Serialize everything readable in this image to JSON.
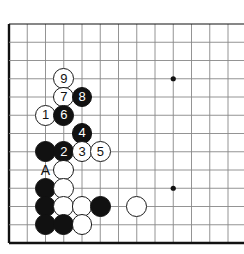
{
  "diagram": {
    "type": "go-board-diagram",
    "board": {
      "origin_x": 9,
      "origin_y": 24,
      "spacing": 18.25,
      "cols": 13,
      "rows": 13,
      "edges": {
        "left": true,
        "top": true,
        "bottom": true,
        "right": false
      },
      "line_color": "#888888",
      "edge_color": "#111111",
      "background": "#ffffff"
    },
    "star_points": [
      {
        "col": 9,
        "row": 3
      },
      {
        "col": 9,
        "row": 9
      }
    ],
    "colors": {
      "black_stone": "#111111",
      "white_stone": "#ffffff",
      "stone_outline": "#1a1a1a",
      "black_number_text": "#ffffff",
      "white_number_text": "#111111"
    },
    "stones": [
      {
        "id": "move-9",
        "color": "white",
        "col": 3,
        "row": 3,
        "label": "9"
      },
      {
        "id": "move-7",
        "color": "white",
        "col": 3,
        "row": 4,
        "label": "7"
      },
      {
        "id": "move-8",
        "color": "black",
        "col": 4,
        "row": 4,
        "label": "8"
      },
      {
        "id": "move-1",
        "color": "white",
        "col": 2,
        "row": 5,
        "label": "1"
      },
      {
        "id": "move-6",
        "color": "black",
        "col": 3,
        "row": 5,
        "label": "6"
      },
      {
        "id": "move-4",
        "color": "black",
        "col": 4,
        "row": 6,
        "label": "4"
      },
      {
        "id": "black-stone-c2r7",
        "color": "black",
        "col": 2,
        "row": 7,
        "label": ""
      },
      {
        "id": "move-2",
        "color": "black",
        "col": 3,
        "row": 7,
        "label": "2"
      },
      {
        "id": "move-3",
        "color": "white",
        "col": 4,
        "row": 7,
        "label": "3"
      },
      {
        "id": "move-5",
        "color": "white",
        "col": 5,
        "row": 7,
        "label": "5"
      },
      {
        "id": "white-stone-c3r8",
        "color": "white",
        "col": 3,
        "row": 8,
        "label": ""
      },
      {
        "id": "black-stone-c2r9",
        "color": "black",
        "col": 2,
        "row": 9,
        "label": ""
      },
      {
        "id": "white-stone-c3r9",
        "color": "white",
        "col": 3,
        "row": 9,
        "label": ""
      },
      {
        "id": "black-stone-c2r10",
        "color": "black",
        "col": 2,
        "row": 10,
        "label": ""
      },
      {
        "id": "white-stone-c3r10",
        "color": "white",
        "col": 3,
        "row": 10,
        "label": ""
      },
      {
        "id": "white-stone-c4r10",
        "color": "white",
        "col": 4,
        "row": 10,
        "label": ""
      },
      {
        "id": "black-stone-c5r10",
        "color": "black",
        "col": 5,
        "row": 10,
        "label": ""
      },
      {
        "id": "white-stone-c7r10",
        "color": "white",
        "col": 7,
        "row": 10,
        "label": ""
      },
      {
        "id": "black-stone-c2r11",
        "color": "black",
        "col": 2,
        "row": 11,
        "label": ""
      },
      {
        "id": "black-stone-c3r11",
        "color": "black",
        "col": 3,
        "row": 11,
        "label": ""
      },
      {
        "id": "white-stone-c4r11",
        "color": "white",
        "col": 4,
        "row": 11,
        "label": ""
      }
    ],
    "point_labels": [
      {
        "id": "point-a",
        "text": "A",
        "col": 2,
        "row": 8
      }
    ],
    "move_numbers": [
      "1",
      "2",
      "3",
      "4",
      "5",
      "6",
      "7",
      "8",
      "9"
    ]
  }
}
